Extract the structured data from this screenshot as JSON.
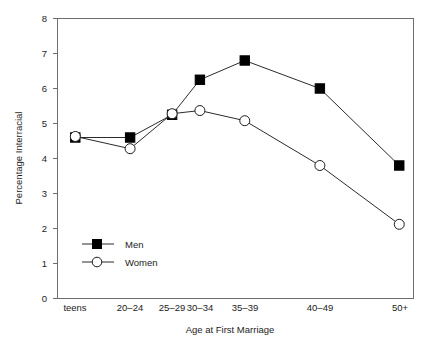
{
  "chart_data": {
    "type": "line",
    "title": "",
    "xlabel": "Age at First Marriage",
    "ylabel": "Percentage Interracial",
    "categories": [
      "teens",
      "20–24",
      "25–29",
      "30–34",
      "35–39",
      "40–49",
      "50+"
    ],
    "series": [
      {
        "name": "Men",
        "marker": "filled-square",
        "values": [
          4.6,
          4.6,
          5.25,
          6.25,
          6.8,
          6.0,
          3.8
        ]
      },
      {
        "name": "Women",
        "marker": "open-circle",
        "values": [
          4.63,
          4.28,
          5.28,
          5.37,
          5.08,
          3.8,
          2.12
        ]
      }
    ],
    "ylim": [
      0,
      8
    ],
    "yticks": [
      0,
      1,
      2,
      3,
      4,
      5,
      6,
      7,
      8
    ],
    "ytick_labels": [
      "0",
      "1",
      "2",
      "3",
      "4",
      "5",
      "6",
      "7",
      "8"
    ],
    "grid": false,
    "legend_position": "inside lower-left",
    "category_x_fractions": [
      0.05,
      0.204,
      0.322,
      0.4,
      0.526,
      0.737,
      0.96
    ],
    "colors": {
      "line": "#2b2b2b",
      "men_marker": "#000000",
      "women_marker_fill": "#ffffff",
      "frame": "#6e6e6e",
      "background": "#ffffff"
    }
  },
  "axes": {
    "y_label": "Percentage Interracial",
    "x_label": "Age at First Marriage",
    "y_ticks": [
      "0",
      "1",
      "2",
      "3",
      "4",
      "5",
      "6",
      "7",
      "8"
    ],
    "x_ticks": [
      "teens",
      "20–24",
      "25–29",
      "30–34",
      "35–39",
      "40–49",
      "50+"
    ]
  },
  "legend": {
    "entries": [
      {
        "label": "Men"
      },
      {
        "label": "Women"
      }
    ]
  }
}
